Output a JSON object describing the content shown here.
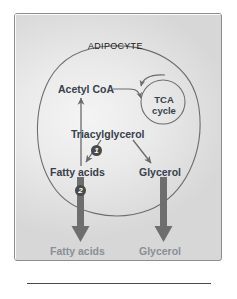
{
  "figure": {
    "type": "biochemical-pathway-diagram",
    "compartments": {
      "cell": {
        "label": "ADIPOCYTE"
      },
      "extracellular": {
        "label": "BLOOD"
      }
    },
    "nodes": {
      "acetyl_coa": "Acetyl CoA",
      "tca_line1": "TCA",
      "tca_line2": "cycle",
      "triacylglycerol": "Triacylglycerol",
      "fatty_acids_cell": "Fatty acids",
      "glycerol_cell": "Glycerol",
      "fatty_acids_blood": "Fatty acids",
      "glycerol_blood": "Glycerol"
    },
    "step_markers": {
      "step_one": "1",
      "step_two": "2"
    },
    "colors": {
      "cell_label": "#1a1a1a",
      "metabolite_in_cell": "#37404c",
      "metabolite_in_blood": "#8a8f96",
      "thin_arrow": "#6a6a6a",
      "thick_arrow": "#6e6e6e",
      "cell_membrane": "#6d6d6d",
      "panel_border": "#8d8d8d",
      "badge_fill": "#4a4a4a",
      "badge_text": "#ffffff"
    }
  }
}
